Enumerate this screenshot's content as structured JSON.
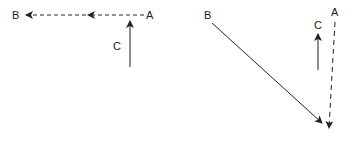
{
  "left_diagram": {
    "labels": {
      "A": "A",
      "B": "B",
      "C": "C"
    },
    "vectors": [
      {
        "name": "A-to-B",
        "style": "dashed",
        "color": "#222222"
      },
      {
        "name": "C",
        "style": "solid",
        "color": "#222222"
      }
    ]
  },
  "right_diagram": {
    "labels": {
      "A": "A",
      "B": "B",
      "C": "C"
    },
    "vectors": [
      {
        "name": "B",
        "style": "solid",
        "color": "#222222"
      },
      {
        "name": "A",
        "style": "dashed",
        "color": "#222222"
      },
      {
        "name": "C",
        "style": "solid",
        "color": "#222222"
      }
    ]
  }
}
